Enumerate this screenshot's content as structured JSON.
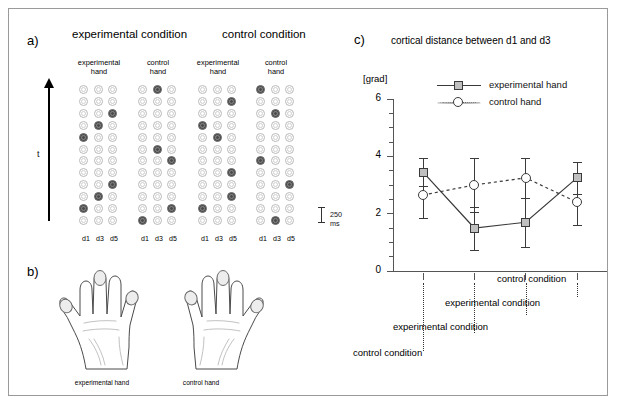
{
  "panels": {
    "a_label": "a)",
    "b_label": "b)",
    "c_label": "c)"
  },
  "panel_a": {
    "condition_titles": [
      "experimental condition",
      "control condition"
    ],
    "hand_titles": [
      "experimental\nhand",
      "control\nhand",
      "experimental\nhand",
      "control\nhand"
    ],
    "hand_title_line1": [
      "experimental",
      "control",
      "experimental",
      "control"
    ],
    "hand_title_line2": [
      "hand",
      "hand",
      "hand",
      "hand"
    ],
    "digit_labels": [
      "d1",
      "d3",
      "d5"
    ],
    "time_axis_label": "t",
    "scalebar_label": "250 ms",
    "matrix_rows": 12,
    "matrix_cols": 3,
    "stimulus_matrices": [
      {
        "name": "experimental-condition-experimental-hand",
        "active": [
          [
            2,
            2
          ],
          [
            3,
            1
          ],
          [
            4,
            0
          ],
          [
            8,
            2
          ],
          [
            9,
            1
          ],
          [
            10,
            0
          ]
        ]
      },
      {
        "name": "experimental-condition-control-hand",
        "active": [
          [
            0,
            1
          ],
          [
            5,
            1
          ],
          [
            6,
            2
          ],
          [
            10,
            2
          ],
          [
            11,
            0
          ]
        ]
      },
      {
        "name": "control-condition-experimental-hand",
        "active": [
          [
            1,
            2
          ],
          [
            3,
            0
          ],
          [
            4,
            1
          ],
          [
            7,
            2
          ],
          [
            9,
            2
          ],
          [
            10,
            0
          ]
        ]
      },
      {
        "name": "control-condition-control-hand",
        "active": [
          [
            0,
            0
          ],
          [
            2,
            1
          ],
          [
            6,
            0
          ],
          [
            8,
            2
          ],
          [
            11,
            1
          ]
        ]
      }
    ]
  },
  "panel_b": {
    "hand_captions": [
      "experimental hand",
      "control hand"
    ],
    "marked_digits": [
      "d1",
      "d3",
      "d5"
    ]
  },
  "chart_data": {
    "type": "line",
    "title": "cortical distance between d1 and d3",
    "ylabel": "[grad]",
    "xlabel": "",
    "ylim": [
      0,
      6
    ],
    "yticks": [
      0,
      2,
      4,
      6
    ],
    "ytick_labels": [
      "0",
      "2",
      "4",
      "6"
    ],
    "minor_tick_step": 0.5,
    "grid": false,
    "legend_position": "top-right",
    "x": [
      1,
      2,
      3,
      4
    ],
    "categories": [
      "control condition",
      "experimental condition",
      "experimental condition",
      "control condition"
    ],
    "series": [
      {
        "name": "experimental hand",
        "marker": "square",
        "linestyle": "solid",
        "values": [
          3.45,
          1.5,
          1.7,
          3.25
        ],
        "errors": [
          0.5,
          0.75,
          0.85,
          0.55
        ]
      },
      {
        "name": "control hand",
        "marker": "circle",
        "linestyle": "dotted",
        "values": [
          2.65,
          3.0,
          3.25,
          2.4
        ],
        "errors": [
          0.8,
          0.95,
          0.7,
          0.8
        ]
      }
    ]
  },
  "colors": {
    "marker_fill": "#c0c0c0",
    "line": "#3a3a3a",
    "axis": "#555555",
    "dot_on": "#4c4c4c",
    "dot_off": "#ffffff",
    "frame": "#9a9a9a"
  }
}
